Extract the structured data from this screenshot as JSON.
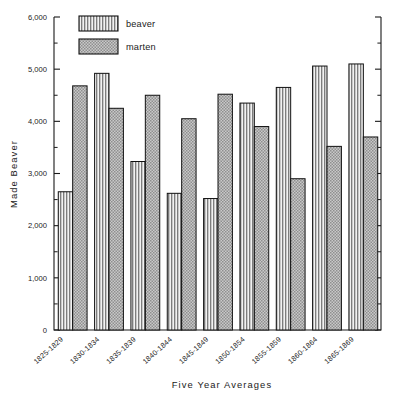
{
  "chart_data": {
    "type": "bar",
    "title": "",
    "xlabel": "Five Year Averages",
    "ylabel": "Made Beaver",
    "ylim": [
      0,
      6000
    ],
    "ytick_step": 1000,
    "yminor_step": 500,
    "grid": false,
    "legend_position": "top-left-inside",
    "categories": [
      "1825-1829",
      "1830-1834",
      "1835-1839",
      "1840-1844",
      "1845-1849",
      "1850-1854",
      "1855-1859",
      "1860-1864",
      "1865-1869"
    ],
    "ytick_labels": [
      "0",
      "1,000",
      "2,000",
      "3,000",
      "4,000",
      "5,000",
      "6,000"
    ],
    "ytick_values": [
      0,
      1000,
      2000,
      3000,
      4000,
      5000,
      6000
    ],
    "series": [
      {
        "name": "beaver",
        "pattern": "vertical-stripes",
        "color": "#d8d8d8",
        "values": [
          2650,
          4920,
          3230,
          2620,
          2520,
          4350,
          4650,
          5060,
          5100
        ]
      },
      {
        "name": "marten",
        "pattern": "checkerboard",
        "color": "#b4b4b4",
        "values": [
          4680,
          4250,
          4500,
          4050,
          4520,
          3900,
          2900,
          3520,
          3700
        ]
      }
    ]
  },
  "legend": {
    "items": [
      {
        "label": "beaver"
      },
      {
        "label": "marten"
      }
    ]
  },
  "axes": {
    "y_title": "Made Beaver",
    "x_title": "Five Year Averages"
  }
}
